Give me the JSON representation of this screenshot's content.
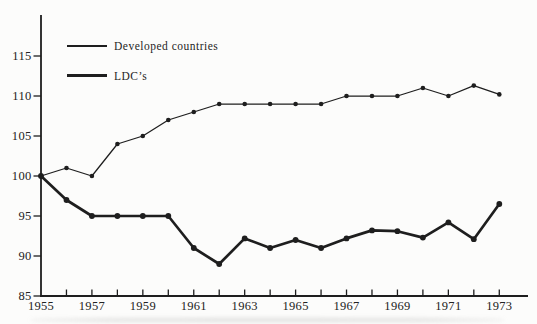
{
  "figure": {
    "background": "#fcfcfb",
    "ink": "#1e1e1e"
  },
  "chart_data": {
    "type": "line",
    "title": "",
    "xlabel": "",
    "ylabel": "",
    "grid": false,
    "x": [
      1955,
      1956,
      1957,
      1958,
      1959,
      1960,
      1961,
      1962,
      1963,
      1964,
      1965,
      1966,
      1967,
      1968,
      1969,
      1970,
      1971,
      1972,
      1973
    ],
    "x_axis": {
      "tick_years": [
        1956,
        1957,
        1958,
        1959,
        1960,
        1961,
        1962,
        1963,
        1964,
        1965,
        1966,
        1967,
        1968,
        1969,
        1970,
        1971,
        1972,
        1973
      ],
      "labeled_years": [
        1955,
        1957,
        1959,
        1961,
        1963,
        1965,
        1967,
        1969,
        1971,
        1973
      ]
    },
    "y_axis": {
      "ticks": [
        85,
        90,
        95,
        100,
        105,
        110,
        115
      ],
      "ylim": [
        85,
        120
      ]
    },
    "legend": {
      "position": "top-left-inside"
    },
    "series": [
      {
        "name": "Developed countries",
        "style": "thin",
        "values": [
          100,
          101,
          100,
          104,
          105,
          107,
          108,
          109,
          109,
          109,
          109,
          109,
          110,
          110,
          110,
          111,
          110,
          111.3,
          110.2
        ]
      },
      {
        "name": "LDC’s",
        "style": "thick",
        "values": [
          100,
          97,
          95,
          95,
          95,
          95,
          91,
          89,
          92.2,
          91,
          92,
          91,
          92.2,
          93.2,
          93.1,
          92.3,
          94.2,
          92.1,
          96.5
        ]
      }
    ]
  }
}
